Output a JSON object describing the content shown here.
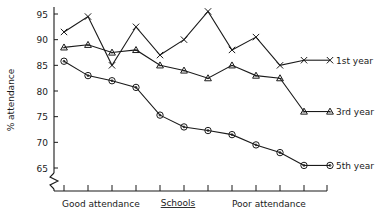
{
  "chart_data": {
    "type": "line",
    "title": "",
    "xlabel": "Schools",
    "ylabel": "% attendance",
    "ylim": [
      63,
      96.5
    ],
    "yticks": [
      65,
      70,
      75,
      80,
      85,
      90,
      95
    ],
    "ytick_labels": [
      "65",
      "70",
      "75",
      "80",
      "85",
      "90",
      "95"
    ],
    "y_axis_break": true,
    "grid": false,
    "legend_position": "right-inside",
    "x": [
      1,
      2,
      3,
      4,
      5,
      6,
      7,
      8,
      9,
      10,
      11
    ],
    "xtick_labels": [
      "",
      "",
      "",
      "",
      "",
      "",
      "",
      "",
      "",
      "",
      ""
    ],
    "x_range_annotations": [
      "Good attendance",
      "Poor attendance"
    ],
    "series": [
      {
        "name": "1st year",
        "marker": "x",
        "values": [
          91.5,
          94.5,
          85.0,
          92.5,
          87.0,
          90.0,
          95.5,
          88.0,
          90.5,
          85.0,
          86.0
        ]
      },
      {
        "name": "3rd year",
        "marker": "triangle",
        "values": [
          88.5,
          89.0,
          87.5,
          88.0,
          85.0,
          84.0,
          82.5,
          85.0,
          83.0,
          82.5,
          76.0
        ]
      },
      {
        "name": "5th year",
        "marker": "circle",
        "values": [
          85.8,
          83.0,
          82.0,
          80.7,
          75.3,
          73.0,
          72.3,
          71.5,
          69.5,
          68.0,
          65.5
        ]
      }
    ]
  },
  "axis": {
    "y_title": "% attendance",
    "x_title": "Schools",
    "good_attendance_label": "Good attendance",
    "poor_attendance_label": "Poor attendance"
  },
  "legend": {
    "entries": [
      {
        "label": "1st year",
        "marker": "x"
      },
      {
        "label": "3rd year",
        "marker": "triangle"
      },
      {
        "label": "5th year",
        "marker": "circle"
      }
    ]
  }
}
